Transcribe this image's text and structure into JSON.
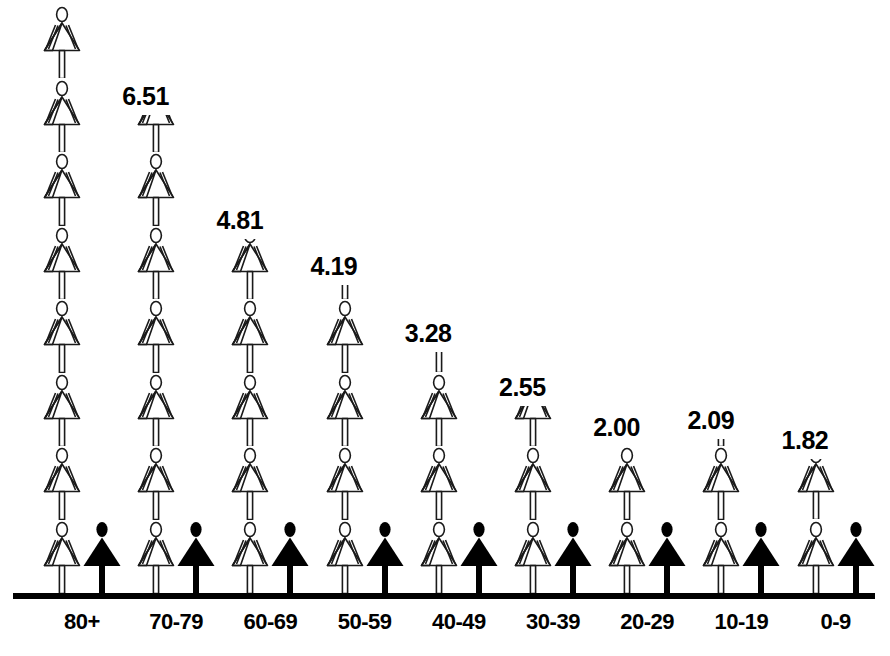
{
  "chart_data": {
    "type": "bar",
    "chart_style": "pictogram-isotype",
    "title": "",
    "subtitle": "",
    "xlabel": "",
    "ylabel": "",
    "categories": [
      "80+",
      "70-79",
      "60-69",
      "50-59",
      "40-49",
      "30-39",
      "20-29",
      "10-19",
      "0-9"
    ],
    "values": [
      7.98,
      6.51,
      4.81,
      4.19,
      3.28,
      2.55,
      2.0,
      2.09,
      1.82
    ],
    "value_labels": [
      "7.98",
      "6.51",
      "4.81",
      "4.19",
      "3.28",
      "2.55",
      "2.00",
      "2.09",
      "1.82"
    ],
    "series": [
      {
        "name": "outlined-figure-stack",
        "style": "outline",
        "values": [
          7.98,
          6.51,
          4.81,
          4.19,
          3.28,
          2.55,
          2.0,
          2.09,
          1.82
        ]
      },
      {
        "name": "solid-figure-reference",
        "style": "filled-black",
        "values": [
          1,
          1,
          1,
          1,
          1,
          1,
          1,
          1,
          1
        ]
      }
    ],
    "ylim": [
      0,
      8.5
    ],
    "grid": false,
    "legend": "none",
    "icon_unit": 1,
    "icon_glyph": "female-figure"
  },
  "colors": {
    "outline": "#1a1a1a",
    "solid": "#000000",
    "axis": "#000000",
    "background": "#ffffff",
    "text": "#000000"
  },
  "axis": {
    "baseline_name": "category-axis"
  }
}
